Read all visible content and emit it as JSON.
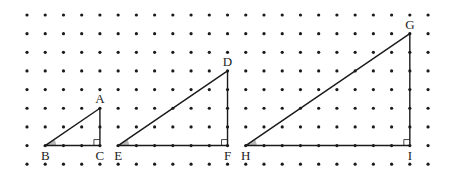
{
  "grid": {
    "cols": 23,
    "rows": 9,
    "origin_x": 27,
    "origin_y": 15,
    "dx": 18.23,
    "dy": 18.65,
    "dot_radius": 1.6,
    "dot_color": "#1a1a1a"
  },
  "line_color": "#1a1a1a",
  "angle_fill": "#b8b8b8",
  "triangles": [
    {
      "name": "ABC",
      "vertices": {
        "apex": {
          "label": "A",
          "col": 4,
          "row": 5
        },
        "angle": {
          "label": "B",
          "col": 1,
          "row": 7
        },
        "right": {
          "label": "C",
          "col": 4,
          "row": 7
        }
      }
    },
    {
      "name": "DEF",
      "vertices": {
        "apex": {
          "label": "D",
          "col": 11,
          "row": 3
        },
        "angle": {
          "label": "E",
          "col": 5,
          "row": 7
        },
        "right": {
          "label": "F",
          "col": 11,
          "row": 7
        }
      }
    },
    {
      "name": "GHI",
      "vertices": {
        "apex": {
          "label": "G",
          "col": 21,
          "row": 1
        },
        "angle": {
          "label": "H",
          "col": 12,
          "row": 7
        },
        "right": {
          "label": "I",
          "col": 21,
          "row": 7
        }
      }
    }
  ]
}
